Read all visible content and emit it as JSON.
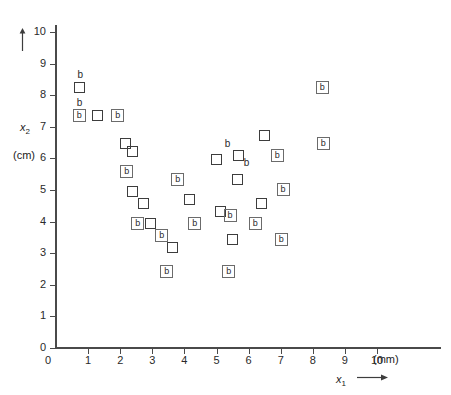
{
  "chart_data": {
    "type": "scatter",
    "title": "",
    "xlabel": "x_1",
    "ylabel": "x_2",
    "xunit": "(mm)",
    "yunit": "(cm)",
    "xlim": [
      0,
      11.2
    ],
    "ylim": [
      0,
      10.5
    ],
    "xticks": [
      0,
      1,
      2,
      3,
      4,
      5,
      6,
      7,
      8,
      9,
      10
    ],
    "yticks": [
      0,
      1,
      2,
      3,
      4,
      5,
      6,
      7,
      8,
      9,
      10
    ],
    "grid": false,
    "legend": "none",
    "marker_kinds": {
      "square": "open square marker",
      "boxed_b": "open square marker containing letter b"
    },
    "points": [
      {
        "x": 0.76,
        "y": 8.23,
        "marker": "square",
        "annotation": "b",
        "annotation_pos": "above"
      },
      {
        "x": 0.74,
        "y": 7.34,
        "marker": "boxed_b",
        "annotation": "b",
        "annotation_pos": "above"
      },
      {
        "x": 1.32,
        "y": 7.34,
        "marker": "square"
      },
      {
        "x": 1.94,
        "y": 7.34,
        "marker": "boxed_b"
      },
      {
        "x": 2.19,
        "y": 6.45,
        "marker": "square"
      },
      {
        "x": 2.41,
        "y": 6.2,
        "marker": "square"
      },
      {
        "x": 2.22,
        "y": 5.57,
        "marker": "boxed_b"
      },
      {
        "x": 2.41,
        "y": 4.94,
        "marker": "square"
      },
      {
        "x": 2.75,
        "y": 4.56,
        "marker": "square"
      },
      {
        "x": 2.56,
        "y": 3.93,
        "marker": "boxed_b"
      },
      {
        "x": 2.97,
        "y": 3.93,
        "marker": "square"
      },
      {
        "x": 3.31,
        "y": 3.55,
        "marker": "boxed_b"
      },
      {
        "x": 3.47,
        "y": 2.41,
        "marker": "boxed_b"
      },
      {
        "x": 3.63,
        "y": 3.17,
        "marker": "square"
      },
      {
        "x": 3.81,
        "y": 5.32,
        "marker": "boxed_b"
      },
      {
        "x": 4.16,
        "y": 4.69,
        "marker": "square"
      },
      {
        "x": 4.34,
        "y": 3.93,
        "marker": "boxed_b"
      },
      {
        "x": 5.0,
        "y": 5.95,
        "marker": "square"
      },
      {
        "x": 5.13,
        "y": 4.31,
        "marker": "square"
      },
      {
        "x": 5.4,
        "y": 2.41,
        "marker": "boxed_b"
      },
      {
        "x": 5.44,
        "y": 4.18,
        "marker": "boxed_b"
      },
      {
        "x": 5.5,
        "y": 3.42,
        "marker": "square"
      },
      {
        "x": 5.69,
        "y": 6.08,
        "marker": "square",
        "annotation": "b",
        "annotation_pos": "above-left",
        "annotation2": "b",
        "annotation2_pos": "below-right"
      },
      {
        "x": 5.66,
        "y": 5.32,
        "marker": "square"
      },
      {
        "x": 6.22,
        "y": 3.93,
        "marker": "boxed_b"
      },
      {
        "x": 6.41,
        "y": 4.56,
        "marker": "square"
      },
      {
        "x": 6.5,
        "y": 6.71,
        "marker": "square"
      },
      {
        "x": 6.91,
        "y": 6.08,
        "marker": "boxed_b"
      },
      {
        "x": 7.03,
        "y": 3.42,
        "marker": "boxed_b"
      },
      {
        "x": 7.09,
        "y": 5.0,
        "marker": "boxed_b"
      },
      {
        "x": 8.31,
        "y": 8.23,
        "marker": "boxed_b"
      },
      {
        "x": 8.34,
        "y": 6.46,
        "marker": "boxed_b"
      }
    ]
  },
  "marker_label": "b"
}
